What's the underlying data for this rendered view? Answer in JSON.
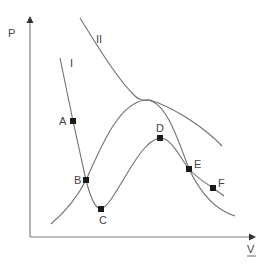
{
  "diagram": {
    "title": "",
    "axes": {
      "y_label": "P",
      "x_label": "V"
    },
    "curves": [
      {
        "label": "I",
        "description": "isotherm with loop"
      },
      {
        "label": "II",
        "description": "higher isotherm"
      },
      {
        "label": "",
        "description": "coexistence dome"
      }
    ],
    "points": [
      {
        "label": "A"
      },
      {
        "label": "B"
      },
      {
        "label": "C"
      },
      {
        "label": "D"
      },
      {
        "label": "E"
      },
      {
        "label": "F"
      }
    ],
    "colors": {
      "curve": "#707070",
      "axis": "#808080",
      "point": "#1a1a1a",
      "text": "#444444"
    }
  }
}
